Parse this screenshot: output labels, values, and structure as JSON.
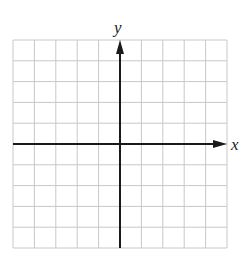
{
  "diagram": {
    "type": "coordinate-grid",
    "x_axis_label": "x",
    "y_axis_label": "y",
    "grid_columns": 10,
    "grid_rows": 10,
    "origin_column_index": 5,
    "origin_row_index": 5,
    "colors": {
      "grid_line": "#c8c8c8",
      "axis": "#1a1a1a",
      "background": "#ffffff"
    }
  }
}
